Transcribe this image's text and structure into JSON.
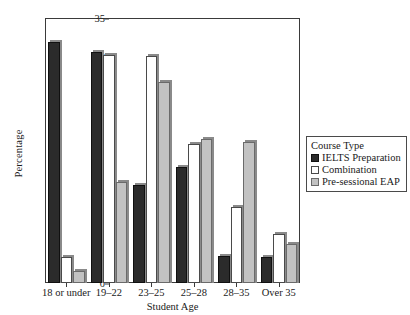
{
  "chart_data": {
    "type": "bar",
    "title": "",
    "xlabel": "Student Age",
    "ylabel": "Percentage",
    "categories": [
      "18 or under",
      "19–22",
      "23–25",
      "25–28",
      "28–35",
      "Over 35"
    ],
    "series": [
      {
        "name": "IELTS Preparation",
        "color": "#2b2b2b",
        "values": [
          31.8,
          30.5,
          13.0,
          15.3,
          3.6,
          3.5
        ]
      },
      {
        "name": "Combination",
        "color": "#ffffff",
        "values": [
          3.5,
          30.1,
          30.0,
          18.3,
          10.0,
          6.5
        ]
      },
      {
        "name": "Pre-sessional EAP",
        "color": "#c2c2c2",
        "values": [
          1.6,
          13.3,
          26.6,
          19.0,
          18.6,
          5.2
        ]
      }
    ],
    "ylim": [
      0,
      35
    ],
    "yticks": [
      0,
      5,
      10,
      15,
      20,
      25,
      30,
      35
    ],
    "ytick_labels": [
      "0",
      "5",
      "10",
      "15",
      "20",
      "25",
      "30",
      "35"
    ],
    "grid": false,
    "legend": {
      "position": "right",
      "title": "Course Type"
    }
  }
}
